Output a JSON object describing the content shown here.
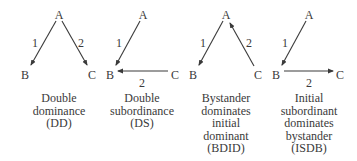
{
  "diagram": {
    "colors": {
      "ink": "#3a3a3a",
      "background": "#ffffff"
    },
    "panels": [
      {
        "id": "DD",
        "center_x": 59,
        "nodes": {
          "A": {
            "label": "A",
            "x": 59,
            "y": 15
          },
          "B": {
            "label": "B",
            "x": 25,
            "y": 75
          },
          "C": {
            "label": "C",
            "x": 92,
            "y": 75
          }
        },
        "edges": [
          {
            "from": "A",
            "to": "B",
            "label": "1",
            "x1": 56,
            "y1": 21,
            "x2": 31,
            "y2": 65,
            "lx": 35,
            "ly": 47
          },
          {
            "from": "A",
            "to": "C",
            "label": "2",
            "x1": 62,
            "y1": 21,
            "x2": 87,
            "y2": 65,
            "lx": 81,
            "ly": 47
          }
        ],
        "caption": [
          "Double",
          "dominance",
          "(DD)"
        ]
      },
      {
        "id": "DS",
        "center_x": 142,
        "nodes": {
          "A": {
            "label": "A",
            "x": 143,
            "y": 15
          },
          "B": {
            "label": "B",
            "x": 110,
            "y": 75
          },
          "C": {
            "label": "C",
            "x": 175,
            "y": 75
          }
        },
        "edges": [
          {
            "from": "A",
            "to": "B",
            "label": "1",
            "x1": 140,
            "y1": 21,
            "x2": 116,
            "y2": 65,
            "lx": 119,
            "ly": 47
          },
          {
            "from": "C",
            "to": "B",
            "label": "2",
            "x1": 168,
            "y1": 71,
            "x2": 118,
            "y2": 71,
            "lx": 142,
            "ly": 87
          }
        ],
        "caption": [
          "Double",
          "subordinance",
          "(DS)"
        ]
      },
      {
        "id": "BDID",
        "center_x": 226,
        "nodes": {
          "A": {
            "label": "A",
            "x": 226,
            "y": 15
          },
          "B": {
            "label": "B",
            "x": 193,
            "y": 75
          },
          "C": {
            "label": "C",
            "x": 258,
            "y": 75
          }
        },
        "edges": [
          {
            "from": "A",
            "to": "B",
            "label": "1",
            "x1": 223,
            "y1": 21,
            "x2": 199,
            "y2": 65,
            "lx": 203,
            "ly": 47
          },
          {
            "from": "C",
            "to": "A",
            "label": "2",
            "x1": 254,
            "y1": 66,
            "x2": 230,
            "y2": 23,
            "lx": 249,
            "ly": 47
          }
        ],
        "caption": [
          "Bystander",
          "dominates",
          "initial",
          "dominant",
          "(BDID)"
        ]
      },
      {
        "id": "ISDB",
        "center_x": 309,
        "nodes": {
          "A": {
            "label": "A",
            "x": 309,
            "y": 15
          },
          "B": {
            "label": "B",
            "x": 276,
            "y": 75
          },
          "C": {
            "label": "C",
            "x": 340,
            "y": 75
          }
        },
        "edges": [
          {
            "from": "A",
            "to": "B",
            "label": "1",
            "x1": 306,
            "y1": 21,
            "x2": 282,
            "y2": 65,
            "lx": 285,
            "ly": 47
          },
          {
            "from": "B",
            "to": "C",
            "label": "2",
            "x1": 284,
            "y1": 71,
            "x2": 333,
            "y2": 71,
            "lx": 309,
            "ly": 87
          }
        ],
        "caption": [
          "Initial",
          "subordinant",
          "dominates",
          "bystander",
          "(ISDB)"
        ]
      }
    ],
    "caption_layout": {
      "first_line_y": 102,
      "line_height": 12.5
    }
  }
}
